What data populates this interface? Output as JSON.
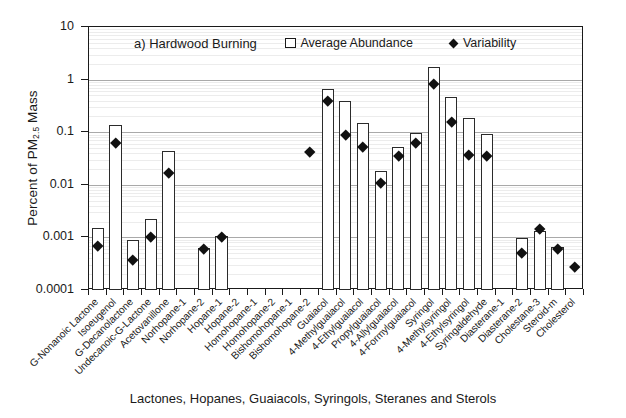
{
  "axes": {
    "y_title_main": "Percent of PM",
    "y_title_sub": "2.5",
    "y_title_tail": " Mass",
    "x_title": "Lactones, Hopanes, Guaiacols, Syringols, Steranes and Sterols",
    "y_ticks": [
      "10",
      "1",
      "0.1",
      "0.01",
      "0.001",
      "0.0001"
    ]
  },
  "panel_label": "a) Hardwood Burning",
  "legend": {
    "series1_label": "Average Abundance",
    "series1_marker": "open-square",
    "series2_label": "Variability",
    "series2_marker": "filled-diamond"
  },
  "chart_data": {
    "type": "bar",
    "title": "a) Hardwood Burning",
    "xlabel": "Lactones, Hopanes, Guaiacols, Syringols, Steranes and Sterols",
    "ylabel": "Percent of PM 2.5 Mass",
    "yscale": "log",
    "ylim": [
      0.0001,
      10
    ],
    "ytick_values": [
      10,
      1,
      0.1,
      0.01,
      0.001,
      0.0001
    ],
    "grid": true,
    "legend_position": "top-inside",
    "categories": [
      "G-Nonanoic Lactone",
      "Isoeugenol",
      "G-Decanolactone",
      "Undecanoic-G-Lactone",
      "Acetovanillone",
      "Norhopane-1",
      "Norhopane-2",
      "Hopane-1",
      "Hopane-2",
      "Homohopane-1",
      "Homohopane-2",
      "Bishomohopane-1",
      "Bishomohopane-2",
      "Guaiacol",
      "4-Methylguaiacol",
      "4-Ethylguaiacol",
      "Propylguaiacol",
      "4-Allylguaiacol",
      "4-Formylguaiacol",
      "Syringol",
      "4-Methylsyringol",
      "4-Ethylsyringol",
      "Syringaldehyde",
      "Diasterane-1",
      "Diasterane-2",
      "Cholestane-3",
      "Steroid-m",
      "Cholesterol"
    ],
    "series": [
      {
        "name": "Average Abundance",
        "marker": "open-square-bar",
        "values": [
          0.0015,
          0.14,
          0.0009,
          0.0022,
          0.043,
          null,
          0.00062,
          0.00105,
          null,
          null,
          null,
          null,
          null,
          0.65,
          0.4,
          0.15,
          0.018,
          0.052,
          0.098,
          1.7,
          0.47,
          0.19,
          0.092,
          null,
          0.00097,
          0.0013,
          0.00065,
          null
        ]
      },
      {
        "name": "Variability",
        "marker": "filled-diamond",
        "values": [
          0.00068,
          0.063,
          0.00038,
          0.00105,
          0.017,
          null,
          0.00062,
          0.00105,
          null,
          null,
          null,
          null,
          0.043,
          0.4,
          0.088,
          0.052,
          0.011,
          0.035,
          0.062,
          0.82,
          0.16,
          0.037,
          0.035,
          null,
          0.0005,
          0.00145,
          0.0006,
          0.00028
        ]
      }
    ]
  },
  "colors": {
    "bar_stroke": "#2b2b2b",
    "bar_fill": "#ffffff",
    "marker": "#111111",
    "grid_major": "#a9a9a9",
    "grid_minor": "#ececec",
    "axis": "#1a1a1a",
    "background": "#ffffff"
  }
}
